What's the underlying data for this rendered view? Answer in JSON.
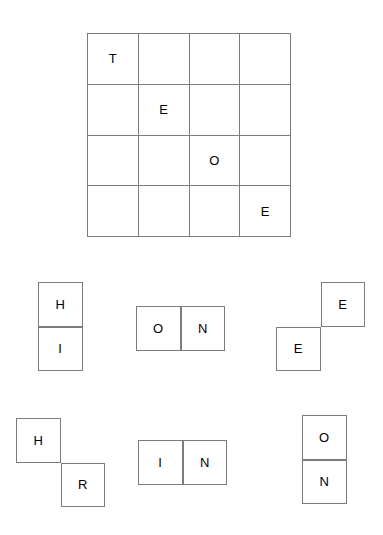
{
  "board": {
    "name": "letter-grid",
    "rows": 4,
    "cols": 4,
    "cell_size": 50.75,
    "x": 87,
    "y": 33,
    "line_color": "#7c7c7c",
    "background_color": "#ffffff",
    "text_color": "#000000",
    "cells": [
      [
        {
          "letter": "T",
          "filled": true
        },
        {
          "letter": "",
          "filled": false
        },
        {
          "letter": "",
          "filled": false
        },
        {
          "letter": "",
          "filled": false
        }
      ],
      [
        {
          "letter": "",
          "filled": false
        },
        {
          "letter": "E",
          "filled": true
        },
        {
          "letter": "",
          "filled": false
        },
        {
          "letter": "",
          "filled": false
        }
      ],
      [
        {
          "letter": "",
          "filled": false
        },
        {
          "letter": "",
          "filled": false
        },
        {
          "letter": "O",
          "filled": true
        },
        {
          "letter": "",
          "filled": false
        }
      ],
      [
        {
          "letter": "",
          "filled": false
        },
        {
          "letter": "",
          "filled": false
        },
        {
          "letter": "",
          "filled": false
        },
        {
          "letter": "E",
          "filled": true
        }
      ]
    ]
  },
  "pieces": [
    {
      "id": "piece-hi",
      "name": "piece-hi-vertical-domino",
      "shape": "vertical-domino",
      "x": 38,
      "y": 282,
      "cell_size": 44.5,
      "letters": [
        "H",
        "I"
      ],
      "cells": [
        {
          "letter": "H",
          "col": 0,
          "row": 0
        },
        {
          "letter": "I",
          "col": 0,
          "row": 1
        }
      ]
    },
    {
      "id": "piece-on-horizontal",
      "name": "piece-on-horizontal-domino",
      "shape": "horizontal-domino",
      "x": 136,
      "y": 306,
      "cell_size": 44.5,
      "letters": [
        "O",
        "N"
      ],
      "cells": [
        {
          "letter": "O",
          "col": 0,
          "row": 0
        },
        {
          "letter": "N",
          "col": 1,
          "row": 0
        }
      ]
    },
    {
      "id": "piece-ee-diagonal",
      "name": "piece-ee-anti-diagonal",
      "shape": "anti-diagonal",
      "x": 276,
      "y": 282,
      "cell_size": 44.5,
      "letters": [
        "E",
        "E"
      ],
      "cells": [
        {
          "letter": "E",
          "col": 1,
          "row": 0
        },
        {
          "letter": "E",
          "col": 0,
          "row": 1
        }
      ]
    },
    {
      "id": "piece-hr-diagonal",
      "name": "piece-hr-diagonal",
      "shape": "diagonal",
      "x": 16,
      "y": 418,
      "cell_size": 44.5,
      "letters": [
        "H",
        "R"
      ],
      "cells": [
        {
          "letter": "H",
          "col": 0,
          "row": 0
        },
        {
          "letter": "R",
          "col": 1,
          "row": 1
        }
      ]
    },
    {
      "id": "piece-in-horizontal",
      "name": "piece-in-horizontal-domino",
      "shape": "horizontal-domino",
      "x": 138,
      "y": 440,
      "cell_size": 44.5,
      "letters": [
        "I",
        "N"
      ],
      "cells": [
        {
          "letter": "I",
          "col": 0,
          "row": 0
        },
        {
          "letter": "N",
          "col": 1,
          "row": 0
        }
      ]
    },
    {
      "id": "piece-on-vertical",
      "name": "piece-on-vertical-domino",
      "shape": "vertical-domino",
      "x": 302,
      "y": 415,
      "cell_size": 44.5,
      "letters": [
        "O",
        "N"
      ],
      "cells": [
        {
          "letter": "O",
          "col": 0,
          "row": 0
        },
        {
          "letter": "N",
          "col": 0,
          "row": 1
        }
      ]
    }
  ]
}
